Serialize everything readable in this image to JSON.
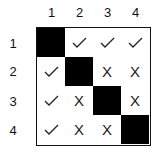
{
  "columns": [
    "1",
    "2",
    "3",
    "4"
  ],
  "rows": [
    "1",
    "2",
    "3",
    "4"
  ],
  "matrix": [
    [
      "filled",
      "check",
      "check",
      "check"
    ],
    [
      "check",
      "filled",
      "x",
      "x"
    ],
    [
      "check",
      "x",
      "filled",
      "x"
    ],
    [
      "check",
      "x",
      "x",
      "filled"
    ]
  ],
  "symbols": {
    "check": "✓",
    "x": "X"
  },
  "colors": {
    "filled": "#000000",
    "border": "#111111"
  }
}
